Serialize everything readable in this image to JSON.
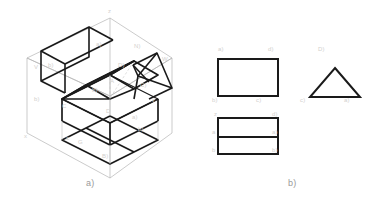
{
  "figure": {
    "width": 372,
    "height": 204,
    "background": "#ffffff"
  },
  "captions": {
    "panel_a": "a)",
    "panel_b": "b)"
  },
  "colors": {
    "solid_line": "#1a1a1a",
    "projection_box_line": "#b5b5b5",
    "hidden_line": "#c8c8c8",
    "faint_label": "#d2d0ce",
    "caption": "#9a9a9a",
    "background": "#ffffff"
  },
  "panel_a": {
    "name": "isometric-projection-box",
    "description": "Isometric glass-box projection of a house-shaped solid with a rectangular base and triangular prism roof, showing projections onto the frontal, horizontal and profile planes",
    "projection_box": {
      "top_vertex": [
        110,
        18
      ],
      "left_vertex": [
        27,
        58
      ],
      "right_vertex": [
        172,
        58
      ],
      "bottom_vertex": [
        110,
        178
      ],
      "left_bottom": [
        27,
        133
      ],
      "right_bottom": [
        172,
        133
      ],
      "center": [
        110,
        96
      ]
    },
    "solid": {
      "type": "house",
      "base_box": {
        "front_top_left": [
          62,
          121
        ],
        "front_top_right": [
          110,
          145
        ],
        "back_top_right": [
          158,
          121
        ],
        "back_top_left": [
          110,
          98
        ],
        "height": 22
      },
      "roof": {
        "ridge_start": [
          86,
          85
        ],
        "ridge_end": [
          134,
          61
        ],
        "eave_left": [
          62,
          99
        ],
        "eave_right": [
          158,
          99
        ]
      }
    },
    "projections": {
      "frontal_plane_view": "rectangle",
      "profile_plane_view": "triangle",
      "horizontal_plane_view": "rectangle-with-ridge-line"
    }
  },
  "panel_b": {
    "name": "orthographic-views",
    "description": "Three orthographic projection views resulting from the glass box",
    "views": [
      {
        "id": "front-view",
        "shape": "rectangle",
        "x": 218,
        "y": 59,
        "width": 60,
        "height": 37
      },
      {
        "id": "side-view",
        "shape": "triangle",
        "apex": [
          335,
          68
        ],
        "base_left": [
          310,
          97
        ],
        "base_right": [
          360,
          97
        ]
      },
      {
        "id": "top-view",
        "shape": "rectangle-divided",
        "x": 218,
        "y": 118,
        "width": 60,
        "height": 36,
        "divider_y": 137
      }
    ]
  },
  "faint_labels": {
    "note": "Small degraded gray annotation text present in the scan, largely illegible",
    "panel_a": [
      {
        "text": "z",
        "x": 108,
        "y": 12
      },
      {
        "text": "a)",
        "x": 96,
        "y": 45
      },
      {
        "text": "V",
        "x": 36,
        "y": 68
      },
      {
        "text": "b)",
        "x": 48,
        "y": 66
      },
      {
        "text": "D)",
        "x": 118,
        "y": 66
      },
      {
        "text": "W",
        "x": 163,
        "y": 60
      },
      {
        "text": "N)",
        "x": 136,
        "y": 47
      },
      {
        "text": "C)",
        "x": 140,
        "y": 86
      },
      {
        "text": "A",
        "x": 110,
        "y": 82
      },
      {
        "text": "b)",
        "x": 36,
        "y": 100
      },
      {
        "text": "y",
        "x": 152,
        "y": 100
      },
      {
        "text": "C",
        "x": 62,
        "y": 107
      },
      {
        "text": "b)",
        "x": 92,
        "y": 91
      },
      {
        "text": "D",
        "x": 106,
        "y": 112
      },
      {
        "text": "a)",
        "x": 132,
        "y": 118
      },
      {
        "text": "x",
        "x": 26,
        "y": 137
      },
      {
        "text": "c",
        "x": 66,
        "y": 139
      },
      {
        "text": "G",
        "x": 78,
        "y": 143
      },
      {
        "text": "B)",
        "x": 102,
        "y": 157
      },
      {
        "text": "b)",
        "x": 138,
        "y": 130
      }
    ],
    "panel_b": [
      {
        "text": "a)",
        "x": 218,
        "y": 50
      },
      {
        "text": "d)",
        "x": 268,
        "y": 50
      },
      {
        "text": "b)",
        "x": 214,
        "y": 100
      },
      {
        "text": "c)",
        "x": 258,
        "y": 100
      },
      {
        "text": "D)",
        "x": 318,
        "y": 50
      },
      {
        "text": "c)",
        "x": 302,
        "y": 100
      },
      {
        "text": "a)",
        "x": 344,
        "y": 100
      },
      {
        "text": "z",
        "x": 216,
        "y": 114
      },
      {
        "text": "d)",
        "x": 272,
        "y": 114
      },
      {
        "text": "a",
        "x": 214,
        "y": 132
      },
      {
        "text": "a)",
        "x": 272,
        "y": 132
      },
      {
        "text": "b",
        "x": 214,
        "y": 150
      },
      {
        "text": "b)",
        "x": 272,
        "y": 150
      }
    ]
  }
}
